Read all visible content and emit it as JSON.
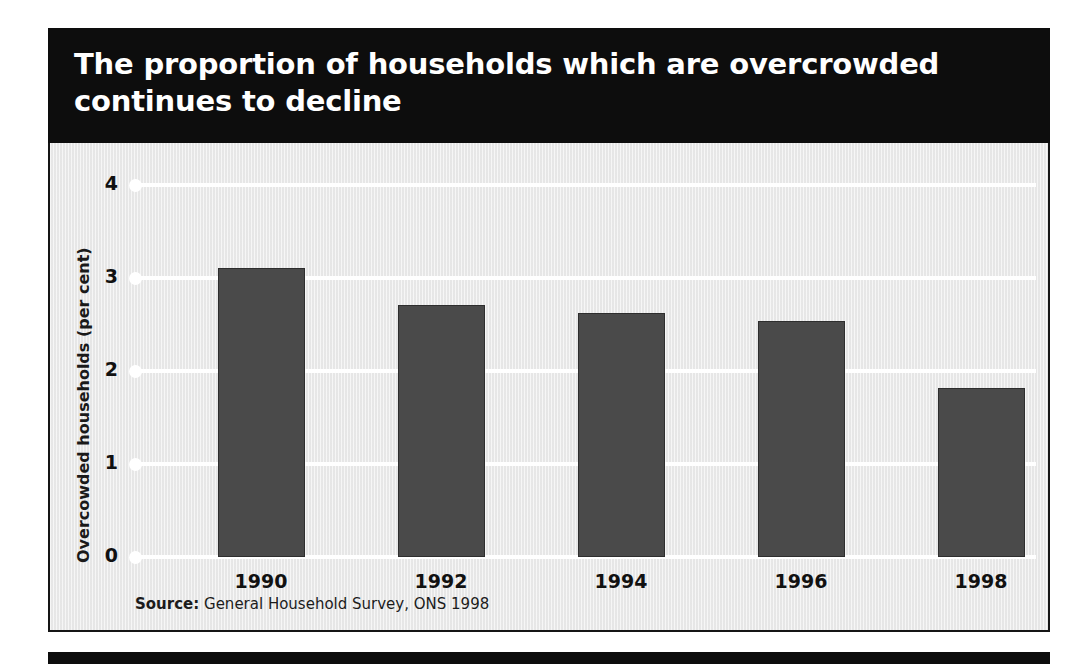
{
  "figure": {
    "title": "The proportion of households which are overcrowded\ncontinues to decline",
    "source_label": "Source:",
    "source_text": " General Household Survey, ONS 1998",
    "title_band_color": "#0d0d0d",
    "panel_color": "#ebebeb",
    "bar_color": "#4a4a4a",
    "gridline_color": "#ffffff"
  },
  "chart_data": {
    "type": "bar",
    "title": "The proportion of households which are overcrowded continues to decline",
    "categories": [
      "1990",
      "1992",
      "1994",
      "1996",
      "1998"
    ],
    "values": [
      3.11,
      2.71,
      2.62,
      2.54,
      1.82
    ],
    "xlabel": "",
    "ylabel": "Overcowded households (per cent)",
    "ylim": [
      0,
      4
    ],
    "yticks": [
      "0",
      "1",
      "2",
      "3",
      "4"
    ],
    "ytick_values": [
      0,
      1,
      2,
      3,
      4
    ],
    "grid": true,
    "legend": "none",
    "source": "Source: General Household Survey, ONS 1998"
  }
}
